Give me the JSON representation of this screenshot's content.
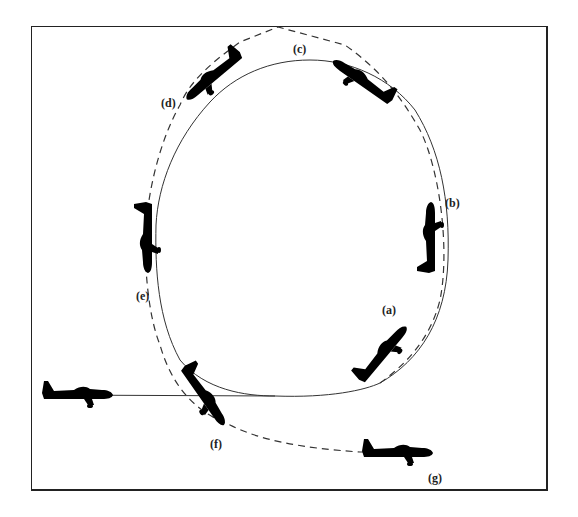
{
  "figure": {
    "colors": {
      "line": "#333333",
      "frame": "#222222",
      "background": "#ffffff"
    }
  },
  "labels": [
    {
      "id": "a",
      "text": "(a)",
      "x": 382,
      "y": 303
    },
    {
      "id": "b",
      "text": "(b)",
      "x": 445,
      "y": 196
    },
    {
      "id": "c",
      "text": "(c)",
      "x": 293,
      "y": 42
    },
    {
      "id": "d",
      "text": "(d)",
      "x": 161,
      "y": 96
    },
    {
      "id": "e",
      "text": "(e)",
      "x": 136,
      "y": 289
    },
    {
      "id": "f",
      "text": "(f)",
      "x": 210,
      "y": 437
    },
    {
      "id": "g",
      "text": "(g)",
      "x": 428,
      "y": 471
    }
  ],
  "paths": {
    "solid_loop": "actual flight path (solid)",
    "dashed_path": "alternate / ideal path (dashed)"
  },
  "aircraft": [
    {
      "id": "start",
      "x": 95,
      "y": 395,
      "rotate": 0,
      "description": "level entry"
    },
    {
      "id": "a",
      "x": 380,
      "y": 355,
      "rotate": -50,
      "description": "climbing"
    },
    {
      "id": "b",
      "x": 428,
      "y": 232,
      "rotate": -90,
      "description": "vertical up"
    },
    {
      "id": "c",
      "x": 350,
      "y": 73,
      "rotate": -145,
      "description": "inverted near top, nose down"
    },
    {
      "id": "d",
      "x": 210,
      "y": 77,
      "rotate": 140,
      "description": "inverted descending"
    },
    {
      "id": "e",
      "x": 145,
      "y": 237,
      "rotate": 90,
      "description": "vertical down"
    },
    {
      "id": "f",
      "x": 210,
      "y": 400,
      "rotate": 55,
      "description": "diving recovery"
    },
    {
      "id": "g",
      "x": 400,
      "y": 453,
      "rotate": 0,
      "description": "level exit"
    }
  ]
}
